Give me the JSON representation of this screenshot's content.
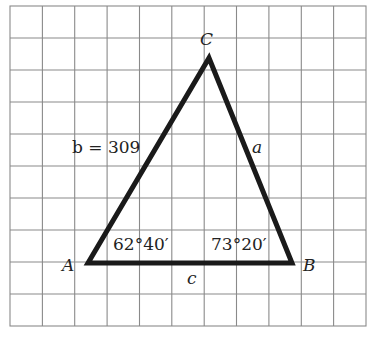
{
  "figure": {
    "type": "triangle-on-grid",
    "grid": {
      "cols": 11,
      "rows": 10,
      "color": "#8a8a8a"
    },
    "stroke_color": "#1a1a1a",
    "vertices": {
      "A": {
        "label": "A"
      },
      "B": {
        "label": "B"
      },
      "C": {
        "label": "C"
      }
    },
    "sides": {
      "a": {
        "label": "a"
      },
      "b": {
        "label": "b = 309"
      },
      "c": {
        "label": "c"
      }
    },
    "angles": {
      "A": {
        "label": "62°40′"
      },
      "B": {
        "label": "73°20′"
      }
    }
  }
}
